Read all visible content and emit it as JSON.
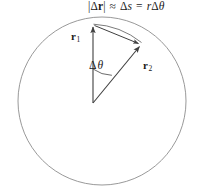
{
  "figure": {
    "equation": {
      "full_text": "|Δr| ≈ Δs = rΔθ",
      "delta_r_magnitude_open": "|",
      "delta_symbol": "Δ",
      "r_vector": "r",
      "delta_r_magnitude_close": "|",
      "approx_symbol": "≈",
      "delta_s": "Δs",
      "delta_s_delta": "Δ",
      "delta_s_var": "s",
      "equals_symbol": "=",
      "radius_var": "r",
      "delta_theta_delta": "Δ",
      "delta_theta_var": "θ"
    },
    "labels": {
      "r1": {
        "base": "r",
        "sub": "1",
        "full": "r₁"
      },
      "r2": {
        "base": "r",
        "sub": "2",
        "full": "r₂"
      },
      "angle": {
        "delta": "Δ",
        "theta": "θ",
        "full": "Δθ"
      }
    },
    "colors": {
      "stroke": "#3f3f3f",
      "circle_stroke": "#8d8d8d",
      "text": "#1a1a1a",
      "background": "#ffffff"
    },
    "geometry": {
      "circle_center_x": 102,
      "circle_center_y": 101,
      "circle_radius": 84,
      "vertex_x": 93,
      "vertex_y": 103,
      "r1_tip_x": 93,
      "r1_tip_y": 25,
      "r2_tip_x": 141,
      "r2_tip_y": 45,
      "angle_arc_radius": 34,
      "delta_theta_degrees": 32
    }
  }
}
